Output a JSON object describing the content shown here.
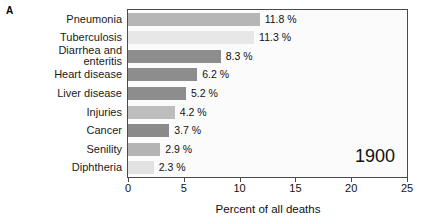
{
  "panel": {
    "letter": "A"
  },
  "annotation": {
    "year": "1900"
  },
  "chart_data": {
    "type": "bar",
    "orientation": "horizontal",
    "title": "",
    "xlabel": "Percent of all deaths",
    "ylabel": "",
    "xlim": [
      0,
      25
    ],
    "xticks": [
      0,
      5,
      10,
      15,
      20,
      25
    ],
    "xtick_labels": [
      "0",
      "5",
      "10",
      "15",
      "20",
      "25"
    ],
    "grid": false,
    "legend": null,
    "categories": [
      "Pneumonia",
      "Tuberculosis",
      "Diarrhea and enteritis",
      "Heart disease",
      "Liver disease",
      "Injuries",
      "Cancer",
      "Senility",
      "Diphtheria"
    ],
    "category_lines": [
      [
        "Pneumonia"
      ],
      [
        "Tuberculosis"
      ],
      [
        "Diarrhea and",
        "enteritis"
      ],
      [
        "Heart disease"
      ],
      [
        "Liver disease"
      ],
      [
        "Injuries"
      ],
      [
        "Cancer"
      ],
      [
        "Senility"
      ],
      [
        "Diphtheria"
      ]
    ],
    "values": [
      11.8,
      11.3,
      8.3,
      6.2,
      5.2,
      4.2,
      3.7,
      2.9,
      2.3
    ],
    "value_labels": [
      "11.8 %",
      "11.3 %",
      "8.3 %",
      "6.2 %",
      "5.2 %",
      "4.2 %",
      "3.7 %",
      "2.9 %",
      "2.3 %"
    ],
    "bar_colors": [
      "#b6b6b6",
      "#e7e7e7",
      "#8d8d8d",
      "#8d8d8d",
      "#8d8d8d",
      "#bdbdbd",
      "#8a8a8a",
      "#b4b4b4",
      "#e2e2e2"
    ]
  },
  "colors": {
    "plot_background": "#fbfbfb",
    "frame": "#4a4a4a",
    "text": "#111111"
  }
}
